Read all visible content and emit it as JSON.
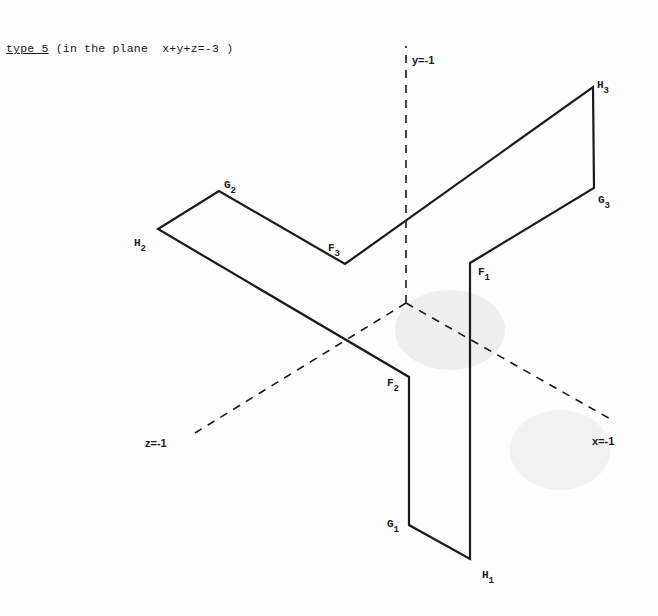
{
  "title": {
    "type_label": "type 5",
    "description": " (in the plane  x+y+z=-3 )"
  },
  "axes": {
    "y": {
      "label": "y=-1"
    },
    "x": {
      "label": "x=-1"
    },
    "z": {
      "label": "z=-1"
    }
  },
  "vertices": {
    "F1": {
      "base": "F",
      "sub": "1"
    },
    "F2": {
      "base": "F",
      "sub": "2"
    },
    "F3": {
      "base": "F",
      "sub": "3"
    },
    "G1": {
      "base": "G",
      "sub": "1"
    },
    "G2": {
      "base": "G",
      "sub": "2"
    },
    "G3": {
      "base": "G",
      "sub": "3"
    },
    "H1": {
      "base": "H",
      "sub": "1"
    },
    "H2": {
      "base": "H",
      "sub": "2"
    },
    "H3": {
      "base": "H",
      "sub": "3"
    }
  },
  "colors": {
    "ink": "#1a1a1a",
    "paper": "#fdfdfd"
  }
}
